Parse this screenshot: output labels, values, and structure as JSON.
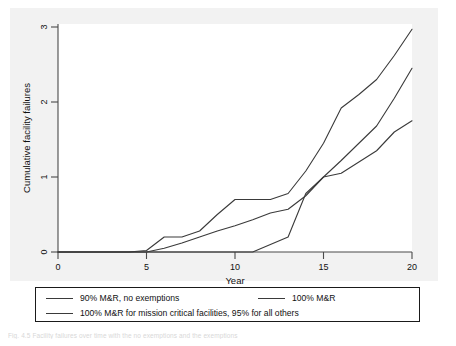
{
  "chart_data": {
    "type": "line",
    "title": "",
    "xlabel": "Year",
    "ylabel": "Cumulative facility failures",
    "xlim": [
      0,
      20
    ],
    "ylim": [
      0,
      3
    ],
    "xticks": [
      "0",
      "5",
      "10",
      "15",
      "20"
    ],
    "yticks": [
      "0",
      "1",
      "2",
      "3"
    ],
    "grid": false,
    "legend_position": "below-plot",
    "series": [
      {
        "name": "90% M&R, no exemptions",
        "color": "#3a3a3a",
        "x": [
          0,
          4,
          5,
          6,
          7,
          8,
          9,
          10,
          12,
          13,
          14,
          15,
          16,
          17,
          18,
          19,
          20
        ],
        "y": [
          0,
          0,
          0.02,
          0.2,
          0.2,
          0.28,
          0.5,
          0.7,
          0.7,
          0.78,
          1.08,
          1.45,
          1.92,
          2.1,
          2.3,
          2.62,
          2.97
        ]
      },
      {
        "name": "100% M&R",
        "color": "#3a3a3a",
        "x": [
          0,
          4,
          5,
          6,
          7,
          8,
          9,
          10,
          11,
          12,
          13,
          14,
          15,
          16,
          17,
          18,
          19,
          20
        ],
        "y": [
          0,
          0,
          0.0,
          0.05,
          0.12,
          0.2,
          0.28,
          0.35,
          0.43,
          0.52,
          0.57,
          0.75,
          1.0,
          1.22,
          1.45,
          1.68,
          2.05,
          2.45
        ]
      },
      {
        "name": "100% M&R for mission critical facilities, 95% for all others",
        "color": "#3a3a3a",
        "x": [
          0,
          11,
          12,
          13,
          14,
          15,
          16,
          17,
          18,
          19,
          20
        ],
        "y": [
          0,
          0,
          0.1,
          0.2,
          0.78,
          1.0,
          1.05,
          1.2,
          1.35,
          1.6,
          1.75
        ]
      }
    ]
  },
  "legend": {
    "entries": [
      {
        "label": "90% M&R, no exemptions"
      },
      {
        "label": "100% M&R"
      },
      {
        "label": "100% M&R for mission critical facilities, 95% for all others"
      }
    ]
  },
  "caption": {
    "text": "Fig. 4.5   Facility failures over time with the no exemptions and the exemptions"
  }
}
